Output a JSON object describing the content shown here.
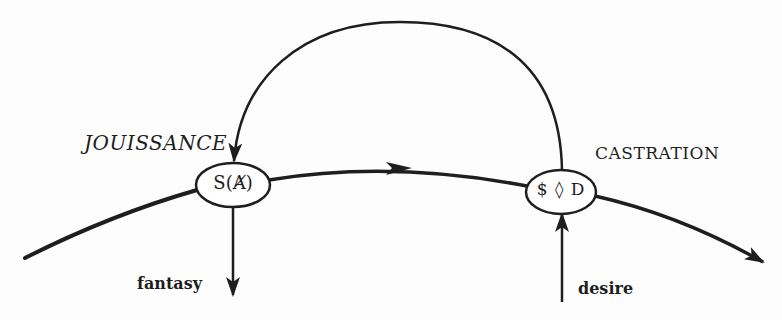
{
  "diagram": {
    "labels": {
      "jouissance": "JOUISSANCE",
      "castration": "CASTRATION",
      "fantasy": "fantasy",
      "desire": "desire"
    },
    "nodes": [
      {
        "id": "barred-other",
        "text": "S(Ⱥ)"
      },
      {
        "id": "drive",
        "text": "$ ◊ D"
      }
    ],
    "edges": [
      {
        "from": "drive",
        "to": "barred-other",
        "type": "upper-arc",
        "direction": "right-to-left"
      },
      {
        "from": "barred-other",
        "to": "drive",
        "type": "main-curve",
        "direction": "left-to-right"
      },
      {
        "from": "barred-other",
        "to": "fantasy",
        "type": "down-arrow"
      },
      {
        "from": "desire",
        "to": "drive",
        "type": "up-arrow"
      }
    ],
    "colors": {
      "stroke": "#1e1e1e",
      "background": "#fdfdfd"
    }
  }
}
